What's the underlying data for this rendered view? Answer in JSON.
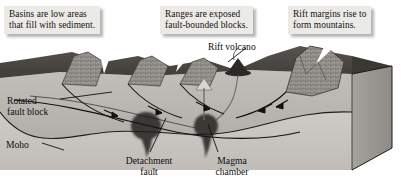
{
  "figure": {
    "kind": "geologic-block-diagram"
  },
  "callouts": [
    {
      "id": "basins",
      "text": "Basins are low areas\nthat fill with sediment."
    },
    {
      "id": "ranges",
      "text": "Ranges are exposed\nfault-bounded blocks."
    },
    {
      "id": "margins",
      "text": "Rift margins rise to\nform mountains."
    }
  ],
  "labels": [
    {
      "id": "rift-volcano",
      "text": "Rift volcano"
    },
    {
      "id": "rotated-fault-block",
      "text": "Rotated\nfault block"
    },
    {
      "id": "moho",
      "text": "Moho"
    },
    {
      "id": "detachment-fault",
      "text": "Detachment\nfault"
    },
    {
      "id": "magma-chamber",
      "text": "Magma\nchamber"
    }
  ],
  "colors": {
    "page_background": "#ffffff",
    "callout_fill": "#eceae6",
    "text": "#0d0d0d",
    "top_surface_dark": "#4d4a47",
    "top_surface_mid": "#6f6c68",
    "cross_section_crust": "#b9b6b1",
    "cross_section_mantle": "#c9c6c1",
    "block_side_face": "#9a9792",
    "ridge_rock": "#8b8884",
    "magma": "#3a3734",
    "line": "#1a1a1a"
  }
}
